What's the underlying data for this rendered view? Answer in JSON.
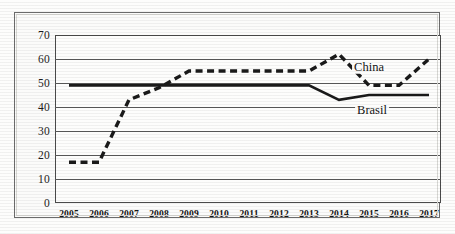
{
  "chart_data": {
    "type": "line",
    "title": "",
    "subtitle": "",
    "xlabel": "",
    "ylabel": "",
    "categories": [
      "2005",
      "2006",
      "2007",
      "2008",
      "2009",
      "2010",
      "2011",
      "2012",
      "2013",
      "2014",
      "2015",
      "2016",
      "2017"
    ],
    "ylim": [
      0,
      70
    ],
    "yticks": [
      0,
      10,
      20,
      30,
      40,
      50,
      60,
      70
    ],
    "ytick_labels": [
      "0",
      "10",
      "20",
      "30",
      "40",
      "50",
      "60",
      "70"
    ],
    "grid": true,
    "legend_position": "inline-annotations",
    "series": [
      {
        "name": "China",
        "style": "dashed",
        "color": "#1a1a1a",
        "values": [
          17,
          17,
          43,
          48,
          55,
          55,
          55,
          55,
          55,
          62,
          49,
          49,
          60
        ]
      },
      {
        "name": "Brasil",
        "style": "solid",
        "color": "#1a1a1a",
        "values": [
          49,
          49,
          49,
          49,
          49,
          49,
          49,
          49,
          49,
          43,
          45,
          45,
          45
        ]
      }
    ],
    "annotations": [
      {
        "text": "China",
        "x_value": 2015.0,
        "y_value": 56.5
      },
      {
        "text": "Brasil",
        "x_value": 2015.1,
        "y_value": 38.8
      }
    ]
  }
}
